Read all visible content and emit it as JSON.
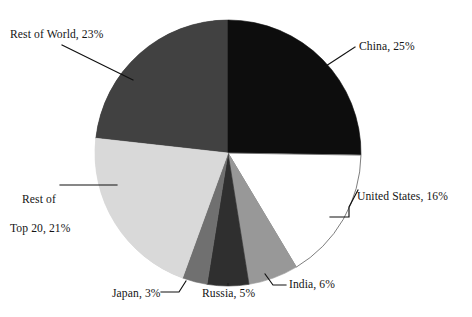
{
  "chart_data": {
    "type": "pie",
    "title": "",
    "subtitle": "",
    "xlabel": "",
    "ylabel": "",
    "legend_position": "none",
    "grid": false,
    "units": "percent",
    "start_angle_deg": 0,
    "direction": "clockwise",
    "categories": [
      "China",
      "United States",
      "India",
      "Russia",
      "Japan",
      "Rest of Top 20",
      "Rest of World"
    ],
    "values": [
      25,
      16,
      6,
      5,
      3,
      21,
      23
    ],
    "slices": [
      {
        "name": "China",
        "value": 25,
        "label": "China, 25%",
        "color": "#0d0d0d",
        "start_deg": 0,
        "end_deg": 90
      },
      {
        "name": "United States",
        "value": 16,
        "label": "United States, 16%",
        "color": "#ffffff",
        "start_deg": 90,
        "end_deg": 147.6
      },
      {
        "name": "India",
        "value": 6,
        "label": "India, 6%",
        "color": "#989898",
        "start_deg": 147.6,
        "end_deg": 169.2
      },
      {
        "name": "Russia",
        "value": 5,
        "label": "Russia, 5%",
        "color": "#2f2f2f",
        "start_deg": 169.2,
        "end_deg": 187.2
      },
      {
        "name": "Japan",
        "value": 3,
        "label": "Japan, 3%",
        "color": "#707070",
        "start_deg": 187.2,
        "end_deg": 198.0
      },
      {
        "name": "Rest of Top 20",
        "value": 21,
        "label_line1": "Rest of",
        "label_line2": "Top 20, 21%",
        "label": "Rest of Top 20, 21%",
        "color": "#d9d9d9",
        "start_deg": 198.0,
        "end_deg": 273.6
      },
      {
        "name": "Rest of World",
        "value": 23,
        "label": "Rest of World, 23%",
        "color": "#414141",
        "start_deg": 273.6,
        "end_deg": 360
      }
    ],
    "total": 99,
    "geometry": {
      "center_x": 228,
      "center_y": 153,
      "radius": 133
    }
  },
  "labels": {
    "china": "China, 25%",
    "united_states": "United States, 16%",
    "india": "India, 6%",
    "russia": "Russia, 5%",
    "japan": "Japan, 3%",
    "rest_of_top20_line1": "Rest of",
    "rest_of_top20_line2": "Top 20, 21%",
    "rest_of_world": "Rest of World, 23%"
  }
}
